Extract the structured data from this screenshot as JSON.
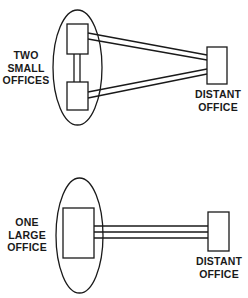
{
  "diagram": {
    "top_group": {
      "group_label": [
        "TWO",
        "SMALL",
        "OFFICES"
      ],
      "remote_label": [
        "DISTANT",
        "OFFICE"
      ]
    },
    "bottom_group": {
      "group_label": [
        "ONE",
        "LARGE",
        "OFFICE"
      ],
      "remote_label": [
        "DISTANT",
        "OFFICE"
      ]
    },
    "colors": {
      "stroke": "#1a1a1a",
      "background": "#ffffff"
    }
  }
}
